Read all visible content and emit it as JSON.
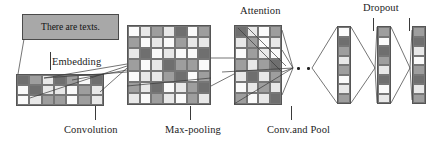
{
  "diagram": {
    "input_box": {
      "text": "There are texts."
    },
    "labels": {
      "embedding": "Embedding",
      "convolution": "Convolution",
      "max_pooling": "Max-pooling",
      "attention": "Attention",
      "conv_and_pool": "Conv.and Pool",
      "dropout": "Dropout"
    },
    "palette": {
      "dark": "#6f6f6f",
      "mid": "#9e9e9e",
      "light": "#e8e8e8",
      "white": "#fafafa",
      "box_fill": "#a8a8a8",
      "line": "#4a4a4a",
      "border": "#555555"
    },
    "matrices": {
      "convolution": {
        "rows": 3,
        "cols": 7,
        "cells": [
          [
            "dark",
            "mid",
            "light",
            "dark",
            "mid",
            "white",
            "dark"
          ],
          [
            "white",
            "dark",
            "light",
            "light",
            "white",
            "mid",
            "light"
          ],
          [
            "white",
            "light",
            "mid",
            "mid",
            "white",
            "mid",
            "light"
          ]
        ]
      },
      "embedding": {
        "rows": 7,
        "cols": 7,
        "cells": [
          [
            "white",
            "light",
            "mid",
            "light",
            "dark",
            "white",
            "mid"
          ],
          [
            "mid",
            "white",
            "light",
            "white",
            "mid",
            "light",
            "light"
          ],
          [
            "light",
            "dark",
            "white",
            "light",
            "white",
            "white",
            "dark"
          ],
          [
            "mid",
            "white",
            "light",
            "dark",
            "mid",
            "mid",
            "white"
          ],
          [
            "white",
            "light",
            "light",
            "mid",
            "dark",
            "white",
            "mid"
          ],
          [
            "mid",
            "light",
            "dark",
            "white",
            "light",
            "mid",
            "dark"
          ],
          [
            "light",
            "white",
            "mid",
            "light",
            "white",
            "mid",
            "light"
          ]
        ]
      },
      "attention": {
        "rows": 7,
        "cols": 4,
        "cells": [
          [
            "dark",
            "light",
            "white",
            "mid"
          ],
          [
            "light",
            "mid",
            "white",
            "light"
          ],
          [
            "white",
            "mid",
            "light",
            "white"
          ],
          [
            "mid",
            "light",
            "mid",
            "dark"
          ],
          [
            "light",
            "dark",
            "light",
            "mid"
          ],
          [
            "white",
            "light",
            "mid",
            "light"
          ],
          [
            "mid",
            "white",
            "light",
            "dark"
          ]
        ]
      }
    },
    "vectors": {
      "v1": {
        "cells": [
          "white",
          "dark",
          "mid",
          "light",
          "mid",
          "white",
          "light",
          "mid"
        ]
      },
      "v2": {
        "cells": [
          "mid",
          "white",
          "dark",
          "mid",
          "light",
          "dark",
          "white",
          "light"
        ]
      },
      "v3": {
        "cells": [
          "mid",
          "dark",
          "light",
          "white",
          "mid",
          "dark",
          "light",
          "mid"
        ]
      }
    },
    "ellipsis": {
      "dots": 2
    }
  }
}
